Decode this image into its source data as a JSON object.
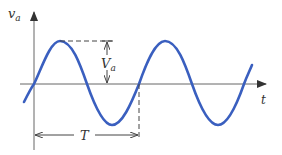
{
  "diagram": {
    "type": "sinusoid",
    "y_axis_label": "v",
    "y_axis_subscript": "a",
    "x_axis_label": "t",
    "amplitude_label": "V",
    "amplitude_subscript": "a",
    "period_label": "T",
    "colors": {
      "curve": "#3a5fbf",
      "axes": "#555555",
      "annotation": "#444444"
    }
  }
}
